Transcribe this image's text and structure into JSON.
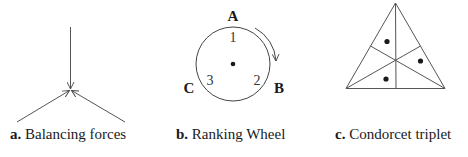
{
  "panels": [
    {
      "id": "a",
      "label": "a.",
      "title": "Balancing forces",
      "description": "Three force arrows meeting at a point: one from above, two from lower left and lower right"
    },
    {
      "id": "b",
      "label": "b.",
      "title": "Ranking Wheel",
      "vertices": {
        "top": "A",
        "right": "B",
        "left": "C"
      },
      "inner_numbers": {
        "top": "1",
        "right": "2",
        "left": "3"
      },
      "rotation": "clockwise-arrow"
    },
    {
      "id": "c",
      "label": "c.",
      "title": "Condorcet triplet",
      "dots": 3,
      "description": "Equilateral triangle divided into six regions by medians, with dots in three alternating regions"
    }
  ],
  "colors": {
    "stroke": "#555555",
    "text": "#1a1a1a",
    "dot": "#1a1a1a"
  }
}
